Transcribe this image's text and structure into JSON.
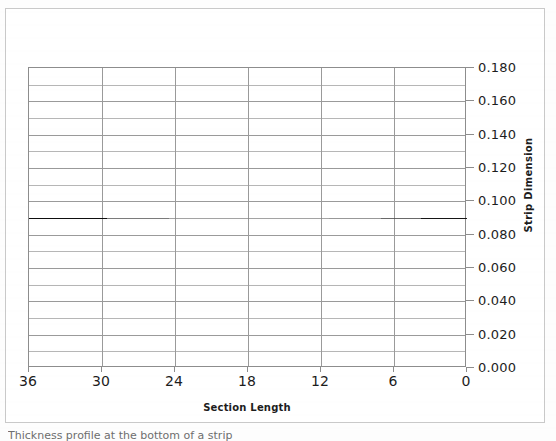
{
  "figure": {
    "caption": "Thickness profile at the bottom of a strip"
  },
  "chart_data": {
    "type": "line",
    "title": "",
    "subtitle": "",
    "xlabel": "Section Length",
    "ylabel": "Strip Dimension",
    "x": [
      36,
      30,
      24,
      18,
      12,
      6,
      0
    ],
    "values": [
      0.09,
      0.09,
      0.09,
      0.09,
      0.09,
      0.09,
      0.09
    ],
    "series": [
      {
        "name": "Strip Dimension",
        "values": [
          0.09,
          0.09,
          0.09,
          0.09,
          0.09,
          0.09,
          0.09
        ],
        "color": "#000000"
      }
    ],
    "xlim": [
      36,
      0
    ],
    "ylim": [
      0.0,
      0.18
    ],
    "x_inverted": true,
    "x_tick_labels": [
      "36",
      "30",
      "24",
      "18",
      "12",
      "6",
      "0"
    ],
    "x_tick_values": [
      36,
      30,
      24,
      18,
      12,
      6,
      0
    ],
    "y_tick_labels": [
      "0.180",
      "0.160",
      "0.140",
      "0.120",
      "0.100",
      "0.080",
      "0.060",
      "0.040",
      "0.020",
      "0.000"
    ],
    "y_tick_values": [
      0.18,
      0.16,
      0.14,
      0.12,
      0.1,
      0.08,
      0.06,
      0.04,
      0.02,
      0.0
    ],
    "y_minor_step": 0.01,
    "grid": {
      "horizontal": true,
      "vertical": true,
      "color": "#9a9a9a"
    },
    "legend": {
      "visible": false,
      "position": "none",
      "entries": []
    },
    "y_axis_position": "right",
    "plot_background": "#ffffff",
    "frame_color": "#c9c9c9"
  }
}
